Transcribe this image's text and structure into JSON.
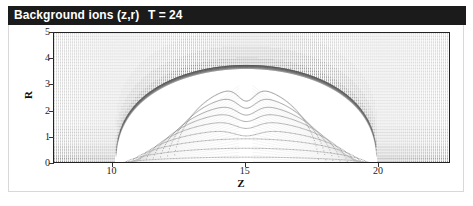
{
  "window": {
    "title": "Background ions (z,r)",
    "time_label": "T = 24",
    "titlebar_bg": "#1b1b1b",
    "titlebar_fg": "#ffffff"
  },
  "chart_data": {
    "type": "scatter",
    "title": "Background ions (z,r)",
    "annotation": "T = 24",
    "xlabel": "Z",
    "ylabel": "R",
    "xlim": [
      7.8,
      22.7
    ],
    "ylim": [
      0,
      5
    ],
    "xticks": [
      10,
      15,
      20
    ],
    "yticks": [
      0,
      1,
      2,
      3,
      4,
      5
    ],
    "grid": false,
    "legend": null,
    "series": [
      {
        "name": "background-ion-mesh",
        "style": "dense-dotted-mesh",
        "color": "#8a8a8a",
        "region": "outside-cavity"
      },
      {
        "name": "cavity-boundary",
        "style": "dense-dark-rim",
        "color": "#4a4a4a",
        "apex": {
          "z": 15.0,
          "r": 3.78
        },
        "left_foot": {
          "z": 10.1,
          "r": 0.0
        },
        "right_foot": {
          "z": 19.9,
          "r": 0.0
        }
      },
      {
        "name": "trajectory-arcs",
        "style": "dotted-curves",
        "color": "#777777",
        "count": 9,
        "peak_radii": [
          0.28,
          0.62,
          0.98,
          1.33,
          1.68,
          2.0,
          2.3,
          2.62,
          2.95
        ]
      }
    ]
  },
  "axes": {
    "y_tick_labels": [
      "5",
      "4",
      "3",
      "2",
      "1",
      "0"
    ],
    "x_tick_labels": [
      "10",
      "15",
      "20"
    ],
    "y_title": "R",
    "x_title": "Z"
  }
}
